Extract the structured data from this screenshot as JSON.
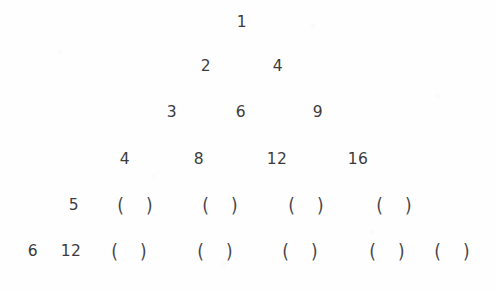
{
  "document": {
    "kind": "worksheet-number-pyramid",
    "title": "Number pyramid worksheet",
    "background_color": "#fefefe",
    "ink_color": "#3c3c3e",
    "blank_token": "(  )",
    "rows": [
      {
        "index": 1,
        "top": 9,
        "cells": [
          {
            "text": "1",
            "x": 242,
            "filled": true
          }
        ]
      },
      {
        "index": 2,
        "top": 53,
        "cells": [
          {
            "text": "2",
            "x": 206,
            "filled": true
          },
          {
            "text": "4",
            "x": 278,
            "filled": true
          }
        ]
      },
      {
        "index": 3,
        "top": 99,
        "cells": [
          {
            "text": "3",
            "x": 172,
            "filled": true
          },
          {
            "text": "6",
            "x": 241,
            "filled": true
          },
          {
            "text": "9",
            "x": 318,
            "filled": true
          }
        ]
      },
      {
        "index": 4,
        "top": 146,
        "cells": [
          {
            "text": "4",
            "x": 125,
            "filled": true
          },
          {
            "text": "8",
            "x": 199,
            "filled": true
          },
          {
            "text": "12",
            "x": 277,
            "filled": true
          },
          {
            "text": "16",
            "x": 358,
            "filled": true
          }
        ]
      },
      {
        "index": 5,
        "top": 192,
        "cells": [
          {
            "text": "5",
            "x": 74,
            "filled": true
          },
          {
            "text": "(  )",
            "x": 135,
            "filled": false
          },
          {
            "text": "(  )",
            "x": 220,
            "filled": false
          },
          {
            "text": "(  )",
            "x": 306,
            "filled": false
          },
          {
            "text": "(  )",
            "x": 394,
            "filled": false
          }
        ]
      },
      {
        "index": 6,
        "top": 238,
        "cells": [
          {
            "text": "6",
            "x": 33,
            "filled": true
          },
          {
            "text": "12",
            "x": 71,
            "filled": true
          },
          {
            "text": "(  )",
            "x": 129,
            "filled": false
          },
          {
            "text": "(  )",
            "x": 215,
            "filled": false
          },
          {
            "text": "(  )",
            "x": 300,
            "filled": false
          },
          {
            "text": "(  )",
            "x": 387,
            "filled": false
          },
          {
            "text": "(  )",
            "x": 452,
            "filled": false
          }
        ]
      }
    ]
  },
  "chart_data": {
    "type": "table",
    "xlabel": "",
    "ylabel": "",
    "rows": [
      [
        "1"
      ],
      [
        "2",
        "4"
      ],
      [
        "3",
        "6",
        "9"
      ],
      [
        "4",
        "8",
        "12",
        "16"
      ],
      [
        "5",
        "(  )",
        "(  )",
        "(  )",
        "(  )"
      ],
      [
        "6",
        "12",
        "(  )",
        "(  )",
        "(  )",
        "(  )",
        "(  )"
      ]
    ],
    "blank_cells": 9,
    "filled_cells": 12
  }
}
